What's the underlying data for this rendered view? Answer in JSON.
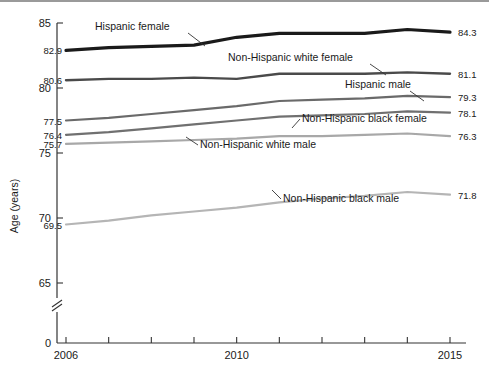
{
  "figure": {
    "y_axis_title": "Age (years)",
    "y_ticks": [
      "85",
      "80",
      "75",
      "70",
      "65",
      "0"
    ],
    "x_ticks": [
      "2006",
      "2010",
      "2015"
    ],
    "axis_break": true
  },
  "chart_data": {
    "type": "line",
    "title": "",
    "xlabel": "",
    "ylabel": "Age (years)",
    "ylim": [
      65,
      85
    ],
    "xlim": [
      2006,
      2015
    ],
    "grid": false,
    "legend": "inline-annotations",
    "axis_break_below": 65,
    "x": [
      2006,
      2007,
      2008,
      2009,
      2010,
      2011,
      2012,
      2013,
      2014,
      2015
    ],
    "series": [
      {
        "name": "Hispanic female",
        "color": "#1a1a1a",
        "width": 3.2,
        "start_label": "82.9",
        "end_label": "84.3",
        "values": [
          82.9,
          83.1,
          83.2,
          83.3,
          83.9,
          84.2,
          84.2,
          84.2,
          84.5,
          84.3
        ]
      },
      {
        "name": "Non-Hispanic white female",
        "color": "#4a4a4a",
        "width": 2.4,
        "start_label": "80.6",
        "end_label": "81.1",
        "values": [
          80.6,
          80.7,
          80.7,
          80.8,
          80.7,
          81.1,
          81.1,
          81.1,
          81.2,
          81.1
        ]
      },
      {
        "name": "Hispanic male",
        "color": "#6a6a6a",
        "width": 2.2,
        "start_label": "77.5",
        "end_label": "79.3",
        "values": [
          77.5,
          77.7,
          78.0,
          78.3,
          78.6,
          79.0,
          79.1,
          79.2,
          79.4,
          79.3
        ]
      },
      {
        "name": "Non-Hispanic black female",
        "color": "#707070",
        "width": 2.2,
        "start_label": "76.4",
        "end_label": "78.1",
        "values": [
          76.4,
          76.6,
          76.9,
          77.2,
          77.5,
          77.8,
          77.9,
          78.0,
          78.2,
          78.1
        ]
      },
      {
        "name": "Non-Hispanic white male",
        "color": "#a8a8a8",
        "width": 2.2,
        "start_label": "75.7",
        "end_label": "76.3",
        "values": [
          75.7,
          75.8,
          75.9,
          76.0,
          76.1,
          76.3,
          76.3,
          76.4,
          76.5,
          76.3
        ]
      },
      {
        "name": "Non-Hispanic black male",
        "color": "#b5b5b5",
        "width": 2.2,
        "start_label": "69.5",
        "end_label": "71.8",
        "values": [
          69.5,
          69.8,
          70.2,
          70.5,
          70.8,
          71.2,
          71.5,
          71.7,
          72.0,
          71.8
        ]
      }
    ],
    "annotations": [
      {
        "text": "Hispanic female",
        "x": 95,
        "y": 30
      },
      {
        "text": "Non-Hispanic white female",
        "x": 228,
        "y": 61
      },
      {
        "text": "Hispanic male",
        "x": 345,
        "y": 88
      },
      {
        "text": "Non-Hispanic black female",
        "x": 302,
        "y": 122
      },
      {
        "text": "Non-Hispanic white male",
        "x": 200,
        "y": 148
      },
      {
        "text": "Non-Hispanic black male",
        "x": 283,
        "y": 202
      }
    ]
  }
}
